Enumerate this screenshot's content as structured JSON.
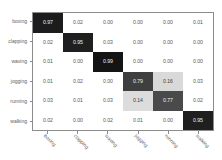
{
  "chart_data": {
    "type": "heatmap",
    "title": "",
    "subtitle": "",
    "xlabel": "",
    "ylabel": "",
    "legend_position": "none",
    "grid": false,
    "colormap": "grayscale-inverted",
    "value_range": [
      0.0,
      1.0
    ],
    "categories": [
      "boxing",
      "clapping",
      "waving",
      "jogging",
      "running",
      "walking"
    ],
    "row_labels": [
      "boxing",
      "clapping",
      "waving",
      "jogging",
      "running",
      "walking"
    ],
    "column_labels": [
      "boxing",
      "clapping",
      "waving",
      "jogging",
      "running",
      "walking"
    ],
    "x_tick_labels": [
      "boxing",
      "clapping",
      "waving",
      "jogging",
      "running",
      "walking"
    ],
    "y_tick_labels": [
      "boxing",
      "clapping",
      "waving",
      "jogging",
      "running",
      "walking"
    ],
    "cell_text_format": "0.00",
    "matrix": [
      [
        "0.97",
        "0.02",
        "0.00",
        "0.00",
        "0.00",
        "0.01"
      ],
      [
        "0.02",
        "0.95",
        "0.03",
        "0.00",
        "0.00",
        "0.00"
      ],
      [
        "0.01",
        "0.00",
        "0.99",
        "0.00",
        "0.00",
        "0.00"
      ],
      [
        "0.01",
        "0.02",
        "0.00",
        "0.79",
        "0.16",
        "0.03"
      ],
      [
        "0.03",
        "0.01",
        "0.03",
        "0.14",
        "0.77",
        "0.02"
      ],
      [
        "0.02",
        "0.00",
        "0.02",
        "0.01",
        "0.00",
        "0.95"
      ]
    ],
    "values": [
      [
        0.97,
        0.02,
        0.0,
        0.0,
        0.0,
        0.01
      ],
      [
        0.02,
        0.95,
        0.03,
        0.0,
        0.0,
        0.0
      ],
      [
        0.01,
        0.0,
        0.99,
        0.0,
        0.0,
        0.0
      ],
      [
        0.01,
        0.02,
        0.0,
        0.79,
        0.16,
        0.03
      ],
      [
        0.03,
        0.01,
        0.03,
        0.14,
        0.77,
        0.02
      ],
      [
        0.02,
        0.0,
        0.02,
        0.01,
        0.0,
        0.95
      ]
    ],
    "cell_fill_colors": [
      [
        "#1c1c1c",
        "#ffffff",
        "#ffffff",
        "#ffffff",
        "#ffffff",
        "#ffffff"
      ],
      [
        "#ffffff",
        "#1f1f1f",
        "#ffffff",
        "#ffffff",
        "#ffffff",
        "#ffffff"
      ],
      [
        "#ffffff",
        "#ffffff",
        "#141414",
        "#ffffff",
        "#ffffff",
        "#ffffff"
      ],
      [
        "#ffffff",
        "#ffffff",
        "#ffffff",
        "#3f3f3f",
        "#d9d9d9",
        "#ffffff"
      ],
      [
        "#ffffff",
        "#ffffff",
        "#ffffff",
        "#dcdcdc",
        "#4a4a4a",
        "#ffffff"
      ],
      [
        "#ffffff",
        "#ffffff",
        "#ffffff",
        "#ffffff",
        "#ffffff",
        "#1f1f1f"
      ]
    ],
    "cell_text_colors": [
      [
        "#f0f0f0",
        "#595959",
        "#595959",
        "#595959",
        "#595959",
        "#595959"
      ],
      [
        "#595959",
        "#f0f0f0",
        "#595959",
        "#595959",
        "#595959",
        "#595959"
      ],
      [
        "#595959",
        "#595959",
        "#f0f0f0",
        "#595959",
        "#595959",
        "#595959"
      ],
      [
        "#595959",
        "#595959",
        "#595959",
        "#f0f0f0",
        "#3d3d3d",
        "#595959"
      ],
      [
        "#595959",
        "#595959",
        "#595959",
        "#3d3d3d",
        "#f0f0f0",
        "#595959"
      ],
      [
        "#595959",
        "#595959",
        "#595959",
        "#595959",
        "#595959",
        "#f0f0f0"
      ]
    ],
    "axis_color": "#8c8c8c",
    "tick_label_color": "#616161",
    "background_color": "#ffffff"
  }
}
